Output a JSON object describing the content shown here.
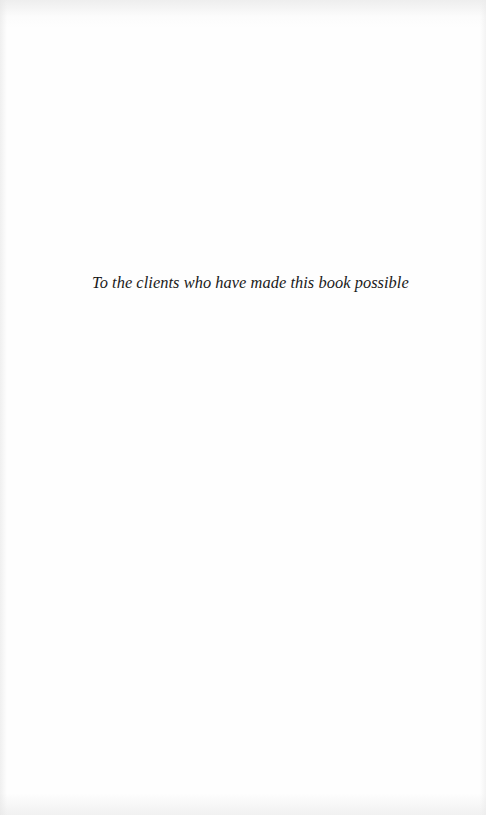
{
  "page": {
    "type": "dedication",
    "background_color": "#fefefe",
    "text_color": "#1a1a1a"
  },
  "dedication": {
    "text": "To the clients who have made this book possible"
  }
}
